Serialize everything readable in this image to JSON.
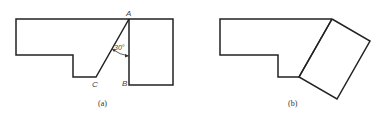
{
  "figures": [
    {
      "id": "a",
      "caption": "(a)",
      "points": {
        "A": "A",
        "B": "B",
        "C": "C"
      },
      "angle_label": "30°"
    },
    {
      "id": "b",
      "caption": "(b)"
    }
  ],
  "colors": {
    "stroke": "#222222",
    "background": "#ffffff"
  }
}
